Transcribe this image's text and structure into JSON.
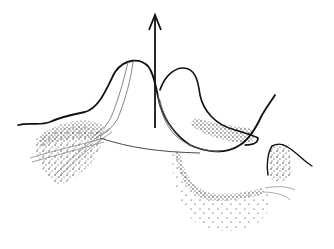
{
  "figure": {
    "type": "line-art illustration",
    "background": "#ffffff",
    "ink_color": "#111111",
    "thin_line_color": "#555555",
    "stipple_color": "#1a1a1a",
    "labels": []
  },
  "elements": {
    "arrow": {
      "direction": "up",
      "x": 155,
      "from_y": 125,
      "to_y": 15
    },
    "left_peak": {
      "description": "bell-shaped raised mound with inner thin contour lines"
    },
    "right_lobe": {
      "description": "curved hook-shaped lobe with stippled lower edge"
    },
    "u_curve": {
      "description": "deep U-shaped curve from right lobe descending and rising"
    },
    "left_stipple": {
      "description": "stippled region with crossing thin lines at lower left"
    },
    "bottom_cavity": {
      "description": "stippled cavity/depression at bottom center"
    },
    "right_step": {
      "description": "stippled step block with sloping line on right"
    }
  }
}
